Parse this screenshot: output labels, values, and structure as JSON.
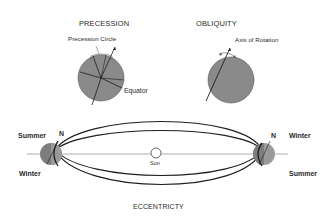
{
  "diagram": {
    "precession": {
      "title": "PRECESSION",
      "circle_label": "Precession Circle",
      "equator_label": "Equator"
    },
    "obliquity": {
      "title": "OBLIQUITY",
      "axis_label": "Axis of Rotation"
    },
    "eccentricity": {
      "title": "ECCENTRICTY",
      "sun_label": "Sun",
      "left_top": "Summer",
      "left_bottom": "Winter",
      "left_north": "N",
      "right_north": "N",
      "right_top": "Winter",
      "right_bottom": "Summer"
    },
    "colors": {
      "globe_fill": "#8a8a8a",
      "line": "#1e1e1e",
      "text": "#2a2a2a",
      "background": "#ffffff"
    }
  }
}
